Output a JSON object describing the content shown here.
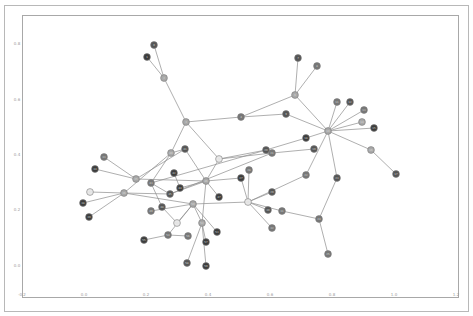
{
  "figure": {
    "width": 473,
    "height": 316,
    "background": "#ffffff"
  },
  "chart_data": {
    "type": "network",
    "title": "",
    "xlabel": "",
    "ylabel": "",
    "xlim": [
      -0.2,
      1.2
    ],
    "ylim": [
      -0.1,
      0.88
    ],
    "grid": false,
    "legend": null,
    "x_ticks": [
      "-0.2",
      "0.0",
      "0.2",
      "0.4",
      "0.6",
      "0.8",
      "1.0",
      "1.2"
    ],
    "y_ticks": [
      "0.0",
      "0.2",
      "0.4",
      "0.6",
      "0.8"
    ],
    "node_colors": {
      "dark": "#3c3c3c",
      "darkmid": "#555555",
      "mid": "#777777",
      "light": "#a8a8a8",
      "white": "#e8e8e8"
    },
    "nodes": [
      {
        "id": "n0",
        "px": 154,
        "py": 45,
        "tone": "darkmid"
      },
      {
        "id": "n1",
        "px": 147,
        "py": 57,
        "tone": "dark"
      },
      {
        "id": "n2",
        "px": 164,
        "py": 78,
        "tone": "light"
      },
      {
        "id": "n3",
        "px": 186,
        "py": 122,
        "tone": "light"
      },
      {
        "id": "n4",
        "px": 241,
        "py": 117,
        "tone": "mid"
      },
      {
        "id": "n5",
        "px": 219,
        "py": 159,
        "tone": "white"
      },
      {
        "id": "n6",
        "px": 295,
        "py": 95,
        "tone": "light"
      },
      {
        "id": "n7",
        "px": 298,
        "py": 58,
        "tone": "darkmid"
      },
      {
        "id": "n8",
        "px": 317,
        "py": 66,
        "tone": "mid"
      },
      {
        "id": "n9",
        "px": 286,
        "py": 114,
        "tone": "darkmid"
      },
      {
        "id": "n10",
        "px": 328,
        "py": 131,
        "tone": "light"
      },
      {
        "id": "n11",
        "px": 337,
        "py": 102,
        "tone": "mid"
      },
      {
        "id": "n12",
        "px": 350,
        "py": 102,
        "tone": "darkmid"
      },
      {
        "id": "n13",
        "px": 364,
        "py": 110,
        "tone": "mid"
      },
      {
        "id": "n14",
        "px": 362,
        "py": 122,
        "tone": "light"
      },
      {
        "id": "n15",
        "px": 374,
        "py": 128,
        "tone": "dark"
      },
      {
        "id": "n16",
        "px": 371,
        "py": 150,
        "tone": "light"
      },
      {
        "id": "n17",
        "px": 396,
        "py": 174,
        "tone": "darkmid"
      },
      {
        "id": "n18",
        "px": 306,
        "py": 138,
        "tone": "dark"
      },
      {
        "id": "n19",
        "px": 314,
        "py": 149,
        "tone": "darkmid"
      },
      {
        "id": "n20",
        "px": 266,
        "py": 150,
        "tone": "darkmid"
      },
      {
        "id": "n21",
        "px": 272,
        "py": 153,
        "tone": "mid"
      },
      {
        "id": "n22",
        "px": 306,
        "py": 175,
        "tone": "mid"
      },
      {
        "id": "n23",
        "px": 337,
        "py": 178,
        "tone": "darkmid"
      },
      {
        "id": "n24",
        "px": 319,
        "py": 219,
        "tone": "mid"
      },
      {
        "id": "n25",
        "px": 328,
        "py": 254,
        "tone": "mid"
      },
      {
        "id": "n26",
        "px": 248,
        "py": 202,
        "tone": "white"
      },
      {
        "id": "n27",
        "px": 241,
        "py": 178,
        "tone": "dark"
      },
      {
        "id": "n28",
        "px": 249,
        "py": 170,
        "tone": "mid"
      },
      {
        "id": "n29",
        "px": 272,
        "py": 192,
        "tone": "darkmid"
      },
      {
        "id": "n30",
        "px": 268,
        "py": 210,
        "tone": "darkmid"
      },
      {
        "id": "n31",
        "px": 282,
        "py": 211,
        "tone": "mid"
      },
      {
        "id": "n32",
        "px": 272,
        "py": 228,
        "tone": "mid"
      },
      {
        "id": "n33",
        "px": 104,
        "py": 157,
        "tone": "mid"
      },
      {
        "id": "n34",
        "px": 95,
        "py": 169,
        "tone": "dark"
      },
      {
        "id": "n35",
        "px": 136,
        "py": 179,
        "tone": "light"
      },
      {
        "id": "n36",
        "px": 124,
        "py": 193,
        "tone": "light"
      },
      {
        "id": "n37",
        "px": 90,
        "py": 192,
        "tone": "white"
      },
      {
        "id": "n38",
        "px": 83,
        "py": 203,
        "tone": "dark"
      },
      {
        "id": "n39",
        "px": 89,
        "py": 217,
        "tone": "dark"
      },
      {
        "id": "n40",
        "px": 171,
        "py": 153,
        "tone": "light"
      },
      {
        "id": "n41",
        "px": 185,
        "py": 149,
        "tone": "darkmid"
      },
      {
        "id": "n42",
        "px": 174,
        "py": 173,
        "tone": "dark"
      },
      {
        "id": "n43",
        "px": 151,
        "py": 183,
        "tone": "mid"
      },
      {
        "id": "n44",
        "px": 180,
        "py": 188,
        "tone": "dark"
      },
      {
        "id": "n45",
        "px": 170,
        "py": 194,
        "tone": "darkmid"
      },
      {
        "id": "n46",
        "px": 206,
        "py": 181,
        "tone": "light"
      },
      {
        "id": "n47",
        "px": 219,
        "py": 197,
        "tone": "dark"
      },
      {
        "id": "n48",
        "px": 162,
        "py": 207,
        "tone": "darkmid"
      },
      {
        "id": "n49",
        "px": 151,
        "py": 211,
        "tone": "mid"
      },
      {
        "id": "n50",
        "px": 193,
        "py": 204,
        "tone": "light"
      },
      {
        "id": "n51",
        "px": 177,
        "py": 223,
        "tone": "white"
      },
      {
        "id": "n52",
        "px": 202,
        "py": 223,
        "tone": "light"
      },
      {
        "id": "n53",
        "px": 217,
        "py": 232,
        "tone": "dark"
      },
      {
        "id": "n54",
        "px": 168,
        "py": 235,
        "tone": "mid"
      },
      {
        "id": "n55",
        "px": 144,
        "py": 240,
        "tone": "dark"
      },
      {
        "id": "n56",
        "px": 188,
        "py": 236,
        "tone": "mid"
      },
      {
        "id": "n57",
        "px": 206,
        "py": 242,
        "tone": "dark"
      },
      {
        "id": "n58",
        "px": 187,
        "py": 263,
        "tone": "darkmid"
      },
      {
        "id": "n59",
        "px": 206,
        "py": 266,
        "tone": "dark"
      }
    ],
    "edges": [
      [
        "n0",
        "n2"
      ],
      [
        "n1",
        "n2"
      ],
      [
        "n2",
        "n3"
      ],
      [
        "n3",
        "n4"
      ],
      [
        "n3",
        "n5"
      ],
      [
        "n3",
        "n40"
      ],
      [
        "n4",
        "n6"
      ],
      [
        "n6",
        "n7"
      ],
      [
        "n6",
        "n8"
      ],
      [
        "n6",
        "n10"
      ],
      [
        "n4",
        "n9"
      ],
      [
        "n9",
        "n10"
      ],
      [
        "n10",
        "n11"
      ],
      [
        "n10",
        "n12"
      ],
      [
        "n10",
        "n13"
      ],
      [
        "n10",
        "n14"
      ],
      [
        "n10",
        "n15"
      ],
      [
        "n10",
        "n16"
      ],
      [
        "n16",
        "n17"
      ],
      [
        "n10",
        "n18"
      ],
      [
        "n10",
        "n22"
      ],
      [
        "n10",
        "n23"
      ],
      [
        "n18",
        "n20"
      ],
      [
        "n19",
        "n21"
      ],
      [
        "n5",
        "n20"
      ],
      [
        "n5",
        "n21"
      ],
      [
        "n5",
        "n46"
      ],
      [
        "n22",
        "n26"
      ],
      [
        "n23",
        "n24"
      ],
      [
        "n24",
        "n25"
      ],
      [
        "n24",
        "n31"
      ],
      [
        "n31",
        "n26"
      ],
      [
        "n26",
        "n27"
      ],
      [
        "n26",
        "n28"
      ],
      [
        "n26",
        "n30"
      ],
      [
        "n26",
        "n29"
      ],
      [
        "n26",
        "n32"
      ],
      [
        "n26",
        "n50"
      ],
      [
        "n33",
        "n35"
      ],
      [
        "n34",
        "n35"
      ],
      [
        "n35",
        "n46"
      ],
      [
        "n35",
        "n41"
      ],
      [
        "n36",
        "n37"
      ],
      [
        "n36",
        "n38"
      ],
      [
        "n36",
        "n39"
      ],
      [
        "n36",
        "n40"
      ],
      [
        "n36",
        "n45"
      ],
      [
        "n36",
        "n50"
      ],
      [
        "n40",
        "n41"
      ],
      [
        "n40",
        "n43"
      ],
      [
        "n41",
        "n46"
      ],
      [
        "n42",
        "n44"
      ],
      [
        "n43",
        "n48"
      ],
      [
        "n43",
        "n45"
      ],
      [
        "n44",
        "n46"
      ],
      [
        "n45",
        "n46"
      ],
      [
        "n46",
        "n47"
      ],
      [
        "n46",
        "n52"
      ],
      [
        "n46",
        "n27"
      ],
      [
        "n48",
        "n51"
      ],
      [
        "n50",
        "n51"
      ],
      [
        "n50",
        "n52"
      ],
      [
        "n50",
        "n53"
      ],
      [
        "n50",
        "n54"
      ],
      [
        "n52",
        "n57"
      ],
      [
        "n52",
        "n58"
      ],
      [
        "n52",
        "n59"
      ],
      [
        "n54",
        "n55"
      ],
      [
        "n54",
        "n56"
      ],
      [
        "n49",
        "n50"
      ],
      [
        "n20",
        "n43"
      ],
      [
        "n21",
        "n45"
      ]
    ]
  }
}
